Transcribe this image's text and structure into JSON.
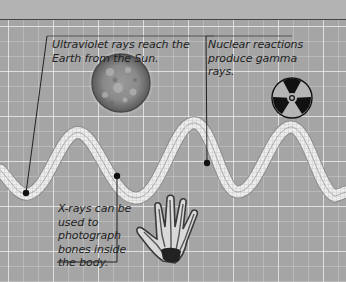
{
  "diagram": {
    "type": "electromagnetic-wave-illustration",
    "colors": {
      "background": "#a5a5a5",
      "top_band": "#b3b3b3",
      "grid_line": "#d8d8d8",
      "callout_line": "#222222",
      "wave_fill": "#e8e8e8"
    },
    "callouts": [
      {
        "id": "uv",
        "text": "Ultraviolet rays reach the Earth from the Sun.",
        "icon": "sun-icon"
      },
      {
        "id": "nuclear",
        "text": "Nuclear reactions produce gamma rays.",
        "icon": "radiation-icon"
      },
      {
        "id": "xray",
        "text": "X-rays can be used to photograph bones inside the body.",
        "icon": "xray-hand-icon"
      }
    ]
  }
}
